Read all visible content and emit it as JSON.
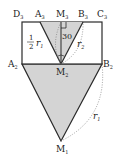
{
  "diagram": {
    "labels": {
      "D3": {
        "main": "D",
        "sub": "3"
      },
      "A3": {
        "main": "A",
        "sub": "3"
      },
      "M3": {
        "main": "M",
        "sub": "3"
      },
      "B3": {
        "main": "B",
        "sub": "3"
      },
      "C3": {
        "main": "C",
        "sub": "3"
      },
      "A2": {
        "main": "A",
        "sub": "2"
      },
      "B2": {
        "main": "B",
        "sub": "2"
      },
      "M2": {
        "main": "M",
        "sub": "2"
      },
      "M1": {
        "main": "M",
        "sub": "1"
      }
    },
    "annotations": {
      "half_num": "1",
      "half_den": "2",
      "r1_top": {
        "main": "r",
        "sub": "1"
      },
      "r2": {
        "main": "r",
        "sub": "2"
      },
      "r1_bottom": {
        "main": "r",
        "sub": "1"
      },
      "angle": "30"
    },
    "colors": {
      "stroke": "#2a2a2a",
      "fill": "#d4d4d4",
      "dotted": "#777777"
    }
  }
}
